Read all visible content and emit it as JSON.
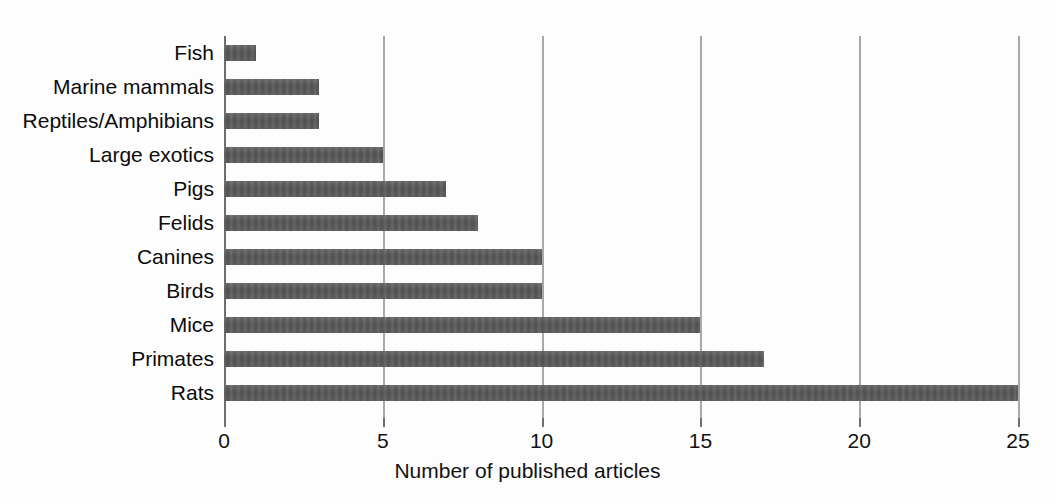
{
  "chart_data": {
    "type": "bar",
    "orientation": "horizontal",
    "title": "",
    "xlabel": "Number of published articles",
    "ylabel": "",
    "categories": [
      "Fish",
      "Marine mammals",
      "Reptiles/Amphibians",
      "Large exotics",
      "Pigs",
      "Felids",
      "Canines",
      "Birds",
      "Mice",
      "Primates",
      "Rats"
    ],
    "values": [
      1,
      3,
      3,
      5,
      7,
      8,
      10,
      10,
      15,
      17,
      25
    ],
    "xlim": [
      0,
      25
    ],
    "xticks": [
      0,
      5,
      10,
      15,
      20,
      25
    ],
    "xtick_labels": [
      "0",
      "5",
      "10",
      "15",
      "20",
      "25"
    ],
    "grid": true,
    "grid_axis": "x",
    "legend": false,
    "bar_color": "#5a5a5a",
    "grid_color": "#a8a8a8",
    "axis_color": "#6e6e6e",
    "background_color": "#ffffff"
  }
}
